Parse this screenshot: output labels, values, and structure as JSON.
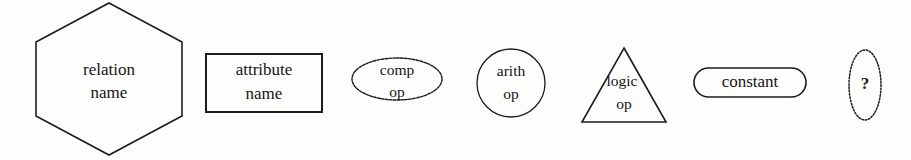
{
  "diagram": {
    "background_color": "#fdfdfb",
    "stroke_color": "#1c1c1c",
    "text_color": "#151515"
  },
  "nodes": [
    {
      "id": "relation-node",
      "shape": "hexagon",
      "outline_style": "solid",
      "line1": "relation",
      "line2": "name"
    },
    {
      "id": "attribute-node",
      "shape": "rectangle",
      "outline_style": "solid",
      "line1": "attribute",
      "line2": "name"
    },
    {
      "id": "comparison-operator-node",
      "shape": "ellipse",
      "outline_style": "dashed",
      "line1": "comp",
      "line2": "op"
    },
    {
      "id": "arithmetic-operator-node",
      "shape": "circle",
      "outline_style": "solid",
      "line1": "arith",
      "line2": "op"
    },
    {
      "id": "logic-operator-node",
      "shape": "triangle",
      "outline_style": "solid",
      "line1": "logic",
      "line2": "op"
    },
    {
      "id": "constant-node",
      "shape": "stadium",
      "outline_style": "solid",
      "line1": "constant",
      "line2": ""
    },
    {
      "id": "unknown-node",
      "shape": "narrow-ellipse",
      "outline_style": "dotted",
      "line1": "?",
      "line2": ""
    }
  ]
}
